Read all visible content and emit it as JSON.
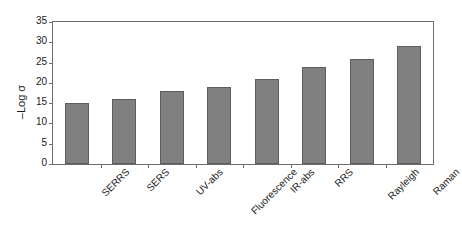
{
  "chart_data": {
    "type": "bar",
    "title": "",
    "xlabel": "",
    "ylabel": "–Log σ",
    "categories": [
      "SERRS",
      "SERS",
      "UV-abs",
      "Fluorescence",
      "IR-abs",
      "RRS",
      "Rayleigh",
      "Raman"
    ],
    "values": [
      15,
      16,
      18,
      19,
      21,
      24,
      26,
      29
    ],
    "ylim": [
      0,
      35
    ],
    "ytick_values": [
      0,
      5,
      10,
      15,
      20,
      25,
      30,
      35
    ],
    "ytick_labels": [
      "0",
      "5",
      "10",
      "15",
      "20",
      "25",
      "30",
      "35"
    ],
    "grid": false,
    "legend": false,
    "bar_color": "#808080",
    "bar_edge_color": "#5e5e5e",
    "axis_color": "#6d6d6d",
    "background_color": "#ffffff",
    "xtick_label_rotation": -45,
    "ylabel_rotation": -90
  }
}
